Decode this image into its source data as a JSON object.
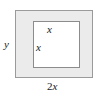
{
  "figure": {
    "type": "geometry-diagram",
    "labels": {
      "height_label": "y",
      "inner_top_label": "x",
      "inner_left_label": "x",
      "width_coefficient": "2",
      "width_variable": "x",
      "width_label": "2x"
    },
    "colors": {
      "shaded_fill": "#ebebeb",
      "inner_fill": "#ffffff",
      "outer_border": "#9a9a9a",
      "inner_border": "#8c8c8c",
      "text": "#1a1a1a",
      "background": "#ffffff"
    },
    "shapes": {
      "outer_rectangle": {
        "name": "outer-rectangle",
        "width_expression": "2x",
        "height_expression": "y"
      },
      "inner_square": {
        "name": "inner-square",
        "side_expression": "x"
      }
    }
  }
}
